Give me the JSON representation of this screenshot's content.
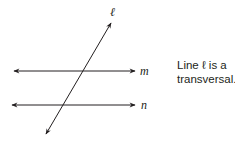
{
  "diagram": {
    "lines": [
      {
        "id": "l",
        "label": "ℓ",
        "role": "transversal"
      },
      {
        "id": "m",
        "label": "m",
        "role": "parallel"
      },
      {
        "id": "n",
        "label": "n",
        "role": "parallel"
      }
    ],
    "caption_line1": "Line ℓ is a",
    "caption_line2": "transversal.",
    "stroke_color": "#231f20"
  }
}
